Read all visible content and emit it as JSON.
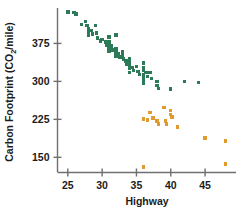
{
  "chart_data": {
    "type": "scatter",
    "title": "",
    "xlabel": "Highway",
    "ylabel": "Carbon Footprint (CO2/mile)",
    "ylabel_main": "Carbon Footprint (CO",
    "ylabel_sub": "2",
    "ylabel_tail": "/mile)",
    "xlim": [
      23.5,
      49.5
    ],
    "ylim": [
      120,
      445
    ],
    "xticks": [
      25,
      30,
      35,
      40,
      45
    ],
    "xtick_labels": [
      "25",
      "30",
      "35",
      "40",
      "45"
    ],
    "yticks": [
      150,
      225,
      300,
      375
    ],
    "ytick_labels": [
      "150",
      "225",
      "300",
      "375"
    ],
    "grid": false,
    "legend": "none",
    "colors": {
      "green": "#2c7a57",
      "orange": "#e09a2e",
      "axis": "#6f6f6f",
      "text": "#1b1b1b",
      "background": "#ffffff"
    },
    "series": [
      {
        "name": "green-group",
        "color": "#2c7a57",
        "points": [
          [
            25.0,
            437
          ],
          [
            25.9,
            436
          ],
          [
            26.2,
            433
          ],
          [
            27.0,
            412
          ],
          [
            27.6,
            418
          ],
          [
            27.8,
            410
          ],
          [
            28.0,
            404
          ],
          [
            28.0,
            398
          ],
          [
            28.0,
            392
          ],
          [
            28.4,
            400
          ],
          [
            28.6,
            394
          ],
          [
            29.0,
            410
          ],
          [
            29.2,
            396
          ],
          [
            29.3,
            386
          ],
          [
            29.8,
            380
          ],
          [
            30.0,
            383
          ],
          [
            30.5,
            378
          ],
          [
            30.7,
            372
          ],
          [
            31.0,
            388
          ],
          [
            31.0,
            378
          ],
          [
            31.0,
            372
          ],
          [
            31.0,
            366
          ],
          [
            31.0,
            360
          ],
          [
            31.4,
            370
          ],
          [
            31.5,
            362
          ],
          [
            32.0,
            392
          ],
          [
            32.0,
            364
          ],
          [
            32.0,
            357
          ],
          [
            32.0,
            350
          ],
          [
            32.4,
            354
          ],
          [
            32.6,
            348
          ],
          [
            33.0,
            358
          ],
          [
            33.0,
            350
          ],
          [
            33.1,
            344
          ],
          [
            33.5,
            340
          ],
          [
            33.6,
            334
          ],
          [
            34.0,
            345
          ],
          [
            34.0,
            338
          ],
          [
            34.0,
            331
          ],
          [
            34.0,
            325
          ],
          [
            34.0,
            318
          ],
          [
            34.4,
            328
          ],
          [
            34.6,
            322
          ],
          [
            35.0,
            330
          ],
          [
            35.2,
            320
          ],
          [
            35.4,
            314
          ],
          [
            36.0,
            336
          ],
          [
            36.0,
            328
          ],
          [
            36.0,
            321
          ],
          [
            36.0,
            314
          ],
          [
            36.0,
            308
          ],
          [
            36.0,
            302
          ],
          [
            36.0,
            296
          ],
          [
            36.4,
            318
          ],
          [
            36.6,
            310
          ],
          [
            37.0,
            318
          ],
          [
            37.2,
            306
          ],
          [
            38.0,
            300
          ],
          [
            38.0,
            292
          ],
          [
            38.2,
            286
          ],
          [
            40.0,
            285
          ],
          [
            42.0,
            300
          ],
          [
            44.0,
            298
          ]
        ]
      },
      {
        "name": "orange-group",
        "color": "#e09a2e",
        "points": [
          [
            36.0,
            226
          ],
          [
            36.6,
            224
          ],
          [
            37.0,
            238
          ],
          [
            37.4,
            228
          ],
          [
            38.0,
            222
          ],
          [
            38.2,
            216
          ],
          [
            39.0,
            248
          ],
          [
            39.2,
            222
          ],
          [
            39.4,
            216
          ],
          [
            40.0,
            242
          ],
          [
            40.0,
            235
          ],
          [
            40.2,
            230
          ],
          [
            41.0,
            210
          ],
          [
            45.0,
            188
          ],
          [
            48.0,
            182
          ],
          [
            36.0,
            131
          ],
          [
            48.0,
            137
          ]
        ]
      }
    ]
  },
  "axes": {
    "x_axis_name": "x-axis",
    "y_axis_name": "y-axis"
  }
}
